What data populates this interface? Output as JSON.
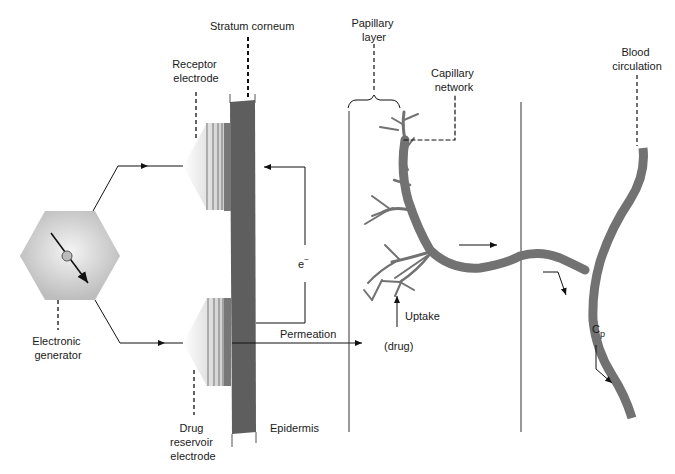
{
  "diagram": {
    "labels": {
      "stratum_corneum": "Stratum corneum",
      "receptor_electrode": [
        "Receptor",
        "electrode"
      ],
      "electronic_generator": [
        "Electronic",
        "generator"
      ],
      "drug_reservoir_electrode": [
        "Drug",
        "reservoir",
        "electrode"
      ],
      "epidermis": "Epidermis",
      "permeation": "Permeation",
      "electron": "e",
      "electron_sup": "−",
      "papillary_layer": [
        "Papillary",
        "layer"
      ],
      "capillary_network": [
        "Capillary",
        "network"
      ],
      "blood_circulation": [
        "Blood",
        "circulation"
      ],
      "uptake": "Uptake",
      "drug": "(drug)",
      "cp": "C",
      "cp_sub": "p"
    },
    "colors": {
      "stratum": "#5e5e5e",
      "vessel": "#727272",
      "hexagon": "#c4c4c4",
      "line": "#111111"
    }
  }
}
